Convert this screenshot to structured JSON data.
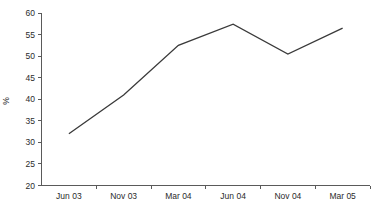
{
  "chart_data": {
    "type": "line",
    "title": "",
    "subtitle": "",
    "xlabel": "",
    "ylabel": "%",
    "categories": [
      "Jun 03",
      "Nov 03",
      "Mar 04",
      "Jun 04",
      "Nov 04",
      "Mar 05"
    ],
    "values": [
      32,
      41,
      52.5,
      57.4,
      50.5,
      56.5
    ],
    "series": [
      {
        "name": "",
        "values": [
          32,
          41,
          52.5,
          57.4,
          50.5,
          56.5
        ]
      }
    ],
    "ylim": [
      20,
      60
    ],
    "y_ticks": [
      20,
      25,
      30,
      35,
      40,
      45,
      50,
      55,
      60
    ],
    "y_tick_labels": [
      "20",
      "25",
      "30",
      "35",
      "40",
      "45",
      "50",
      "55",
      "60"
    ],
    "x_tick_labels": [
      "Jun 03",
      "Nov 03",
      "Mar 04",
      "Jun 04",
      "Nov 04",
      "Mar 05"
    ],
    "grid": false,
    "legend": false,
    "legend_position": "none",
    "markers": false,
    "annotations": [],
    "colors": {
      "background": "#ffffff",
      "line": "#3a3a3a",
      "axis": "#5a5a5a",
      "text": "#2b2b2b"
    }
  }
}
